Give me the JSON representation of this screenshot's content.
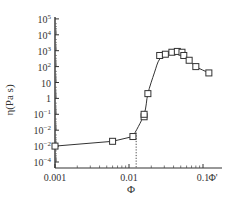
{
  "chart_data": {
    "type": "scatter",
    "title": "",
    "xlabel": "Φ",
    "ylabel": "η(Pa s)",
    "xscale": "log",
    "yscale": "log",
    "xlim": [
      0.001,
      0.13
    ],
    "ylim": [
      0.0001,
      100000
    ],
    "x_tick_labels": [
      "0.001",
      "0.01",
      "0.1",
      "Φ'"
    ],
    "y_tick_labels": [
      "10^5",
      "10^4",
      "10^3",
      "10^2",
      "10",
      "1",
      "10^-1",
      "10^-2",
      "10^-2",
      "10^-4"
    ],
    "grid": false,
    "legend": null,
    "annotations": [
      {
        "type": "vertical-dotted-line",
        "x": 0.0125,
        "label": ""
      },
      {
        "type": "x-axis-marker",
        "label": "Φ'",
        "x": 0.12
      }
    ],
    "series": [
      {
        "name": "measured",
        "marker": "open-square",
        "x": [
          0.001,
          0.006,
          0.0113,
          0.016,
          0.016,
          0.018,
          0.026,
          0.031,
          0.038,
          0.045,
          0.052,
          0.055,
          0.065,
          0.08,
          0.12
        ],
        "y": [
          0.001,
          0.002,
          0.004,
          0.07,
          0.1,
          2,
          500,
          600,
          800,
          900,
          800,
          500,
          250,
          100,
          40
        ]
      }
    ],
    "fit_lines": [
      {
        "name": "low-concentration segment",
        "style": "solid",
        "x": [
          0.001,
          0.006,
          0.0113
        ],
        "y": [
          0.001,
          0.002,
          0.004
        ]
      },
      {
        "name": "steep rise and decay",
        "style": "solid",
        "x": [
          0.0113,
          0.016,
          0.018,
          0.022,
          0.026,
          0.035,
          0.045,
          0.055,
          0.065,
          0.08,
          0.12,
          0.13
        ],
        "y": [
          0.004,
          0.1,
          2,
          40,
          300,
          800,
          950,
          600,
          250,
          100,
          40,
          30
        ]
      }
    ]
  },
  "labels": {
    "ylabel": "η(Pa s)",
    "xlabel": "Φ"
  }
}
